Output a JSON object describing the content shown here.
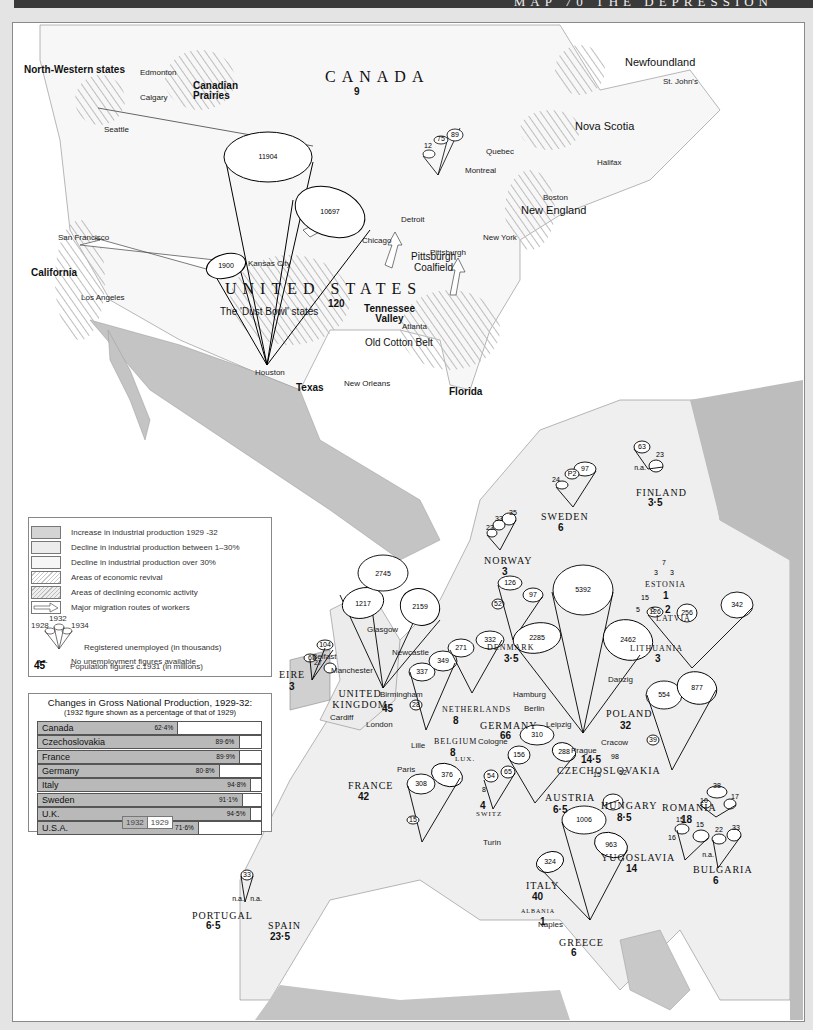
{
  "header": {
    "title": "MAP 70 THE DEPRESSION"
  },
  "legend": {
    "items": [
      {
        "key": "increase",
        "label": "Increase in industrial production 1929 -32",
        "color": "#d4d4d4"
      },
      {
        "key": "decline_1_30",
        "label": "Decline in industrial production between 1–30%",
        "color": "#ececec"
      },
      {
        "key": "decline_30",
        "label": "Decline in industrial production over 30%",
        "color": "#f6f6f6"
      },
      {
        "key": "revival",
        "label": "Areas of economic revival",
        "pattern": "hatch"
      },
      {
        "key": "declining",
        "label": "Areas of declining economic activity",
        "pattern": "hatch"
      },
      {
        "key": "migration",
        "label": "Major migration routes of workers",
        "pattern": "arrow"
      }
    ],
    "cone_years": {
      "left": "1928",
      "middle": "1932",
      "right": "1934"
    },
    "unemployed_label": "Registered unemployed (in thousands)",
    "na_key": "n.a.",
    "na_label": "No unemployment figures available",
    "pop_key": "45",
    "pop_label": "Population figures c.1931 (in millions)"
  },
  "chart_data": {
    "type": "bar",
    "title": "Changes in Gross National Production, 1929-32:",
    "subtitle": "(1932 figure shown as a percentage of that of 1929)",
    "categories": [
      "Canada",
      "Czechoslovakia",
      "France",
      "Germany",
      "Italy",
      "Sweden",
      "U.K.",
      "U.S.A."
    ],
    "values": [
      62.4,
      89.6,
      89.9,
      80.8,
      94.8,
      91.1,
      94.5,
      71.6
    ],
    "value_labels": [
      "62·4%",
      "89·6%",
      "89·9%",
      "80·8%",
      "94·8%",
      "91·1%",
      "94·5%",
      "71·6%"
    ],
    "legend": [
      "1932",
      "1929"
    ],
    "ylim": [
      0,
      100
    ]
  },
  "map": {
    "countries": [
      {
        "name": "CANADA",
        "pop": "9"
      },
      {
        "name": "UNITED STATES",
        "pop": "120"
      },
      {
        "name": "EIRE",
        "pop": "3"
      },
      {
        "name": "UNITED KINGDOM",
        "pop": "45"
      },
      {
        "name": "NORWAY",
        "pop": "3"
      },
      {
        "name": "SWEDEN",
        "pop": "6"
      },
      {
        "name": "FINLAND",
        "pop": "3·5"
      },
      {
        "name": "ESTONIA",
        "pop": "1"
      },
      {
        "name": "LATVIA",
        "pop": "2"
      },
      {
        "name": "LITHUANIA",
        "pop": "3"
      },
      {
        "name": "DENMARK",
        "pop": "3·5"
      },
      {
        "name": "NETHERLANDS",
        "pop": "8"
      },
      {
        "name": "BELGIUM",
        "pop": "8"
      },
      {
        "name": "LUX.",
        "pop": ""
      },
      {
        "name": "GERMANY",
        "pop": "66"
      },
      {
        "name": "POLAND",
        "pop": "32"
      },
      {
        "name": "CZECHOSLOVAKIA",
        "pop": "14·5"
      },
      {
        "name": "FRANCE",
        "pop": "42"
      },
      {
        "name": "SWITZ",
        "pop": "4"
      },
      {
        "name": "AUSTRIA",
        "pop": "6·5"
      },
      {
        "name": "HUNGARY",
        "pop": "8·5"
      },
      {
        "name": "ROMANIA",
        "pop": "18"
      },
      {
        "name": "YUGOSLAVIA",
        "pop": "14"
      },
      {
        "name": "BULGARIA",
        "pop": "6"
      },
      {
        "name": "ITALY",
        "pop": "40"
      },
      {
        "name": "ALBANIA",
        "pop": "1"
      },
      {
        "name": "GREECE",
        "pop": "6"
      },
      {
        "name": "PORTUGAL",
        "pop": "6·5"
      },
      {
        "name": "SPAIN",
        "pop": "23·5"
      }
    ],
    "regions": [
      "North-Western states",
      "Canadian Prairies",
      "Nova Scotia",
      "Newfoundland",
      "New England",
      "California",
      "Pittsburgh Coalfield",
      "Tennessee Valley",
      "Old Cotton Belt",
      "Texas",
      "Florida",
      "The 'Dust Bowl' states"
    ],
    "cities": [
      "Edmonton",
      "Calgary",
      "Seattle",
      "San Francisco",
      "Los Angeles",
      "Kansas City",
      "Chicago",
      "Detroit",
      "Pittsburgh",
      "New York",
      "Boston",
      "Quebec",
      "Montreal",
      "Halifax",
      "St. John's",
      "Atlanta",
      "Houston",
      "New Orleans",
      "Glasgow",
      "Newcastle",
      "Belfast",
      "Manchester",
      "Birmingham",
      "Cardiff",
      "London",
      "Hamburg",
      "Berlin",
      "Leipzig",
      "Cologne",
      "Lille",
      "Paris",
      "Prague",
      "Cracow",
      "Danzig",
      "Turin",
      "Naples"
    ],
    "unemployment": {
      "usa": [
        "1900",
        "11904",
        "10697"
      ],
      "canada": [
        "12",
        "75",
        "89"
      ],
      "uk": [
        "1217",
        "2745",
        "2159"
      ],
      "eire": [
        "27",
        "63",
        "104"
      ],
      "norway": [
        "23",
        "33",
        "35"
      ],
      "sweden": [
        "24",
        "P2",
        "97"
      ],
      "finland": [
        "n.a.",
        "63",
        "23"
      ],
      "denmark": [
        "52",
        "126",
        "97"
      ],
      "germany": [
        "2285",
        "5392",
        "2462"
      ],
      "estonia": [
        "3",
        "7",
        "3"
      ],
      "latvia": [
        "5",
        "15",
        "5"
      ],
      "netherlands": [
        "271",
        "332"
      ],
      "belgium": [
        "28",
        "337",
        "349"
      ],
      "poland_baltic": [
        "126",
        "256",
        "342"
      ],
      "poland": [
        "39",
        "554",
        "877"
      ],
      "france": [
        "15",
        "308",
        "376"
      ],
      "switz": [
        "8",
        "54",
        "65"
      ],
      "austria": [
        "156",
        "310",
        "288"
      ],
      "czechoslovakia": [
        "15",
        "98",
        "52"
      ],
      "hungary": [
        "16",
        "15",
        "15"
      ],
      "italy": [
        "324",
        "1006",
        "963"
      ],
      "romania": [
        "10",
        "38",
        "17"
      ],
      "bulgaria": [
        "n.a.",
        "22",
        "33"
      ],
      "portugal": [
        "n.a.",
        "33",
        "n.a."
      ]
    }
  }
}
